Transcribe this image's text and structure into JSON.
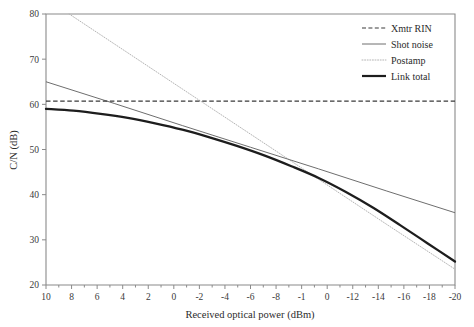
{
  "chart_data": {
    "type": "line",
    "title": "",
    "xlabel": "Received optical power (dBm)",
    "ylabel": "C/N (dB)",
    "xlim": [
      10,
      -20
    ],
    "ylim": [
      20,
      80
    ],
    "x_major_step": 2,
    "x_minor_step": 1,
    "y_major_step": 10,
    "grid": false,
    "legend_position": "top-right",
    "x_tick_labels": [
      "10",
      "8",
      "6",
      "4",
      "2",
      "0",
      "-2",
      "-4",
      "-6",
      "-8",
      "-1",
      "0",
      "-12",
      "-14",
      "-16",
      "-18",
      "-20"
    ],
    "y_tick_labels": [
      "80",
      "70",
      "60",
      "50",
      "40",
      "30",
      "20"
    ],
    "x_tick_values": [
      10,
      8,
      6,
      4,
      2,
      0,
      -2,
      -4,
      -6,
      -8,
      -10,
      -10,
      -12,
      -14,
      -16,
      -18,
      -20
    ],
    "y_tick_values": [
      80,
      70,
      60,
      50,
      40,
      30,
      20
    ],
    "series": [
      {
        "name": "Xmtr RIN",
        "style": "dashed",
        "color": "#3a3a3a",
        "x": [
          10,
          -20
        ],
        "values": [
          60.7,
          60.7
        ]
      },
      {
        "name": "Shot noise",
        "style": "solid-thin",
        "color": "#6e6e6e",
        "x": [
          10,
          5,
          0,
          -5,
          -10,
          -15,
          -20
        ],
        "values": [
          65.0,
          60.2,
          55.3,
          50.5,
          45.7,
          40.8,
          36.0
        ]
      },
      {
        "name": "Postamp",
        "style": "dotted",
        "color": "#b5b5b5",
        "x": [
          8.3,
          5,
          0,
          -5,
          -10,
          -15,
          -20
        ],
        "values": [
          80.0,
          73.4,
          63.4,
          53.4,
          43.4,
          33.4,
          23.5
        ]
      },
      {
        "name": "Link total",
        "style": "solid-thick",
        "color": "#1d1d1d",
        "x": [
          10,
          8,
          6,
          4,
          2,
          0,
          -2,
          -4,
          -6,
          -8,
          -10,
          -12,
          -14,
          -16,
          -18,
          -20
        ],
        "values": [
          59.0,
          58.6,
          57.9,
          57.0,
          55.8,
          54.4,
          52.7,
          50.8,
          48.7,
          46.3,
          43.7,
          40.6,
          37.1,
          33.2,
          29.2,
          25.2
        ]
      }
    ]
  },
  "legend": {
    "items": [
      {
        "label": "Xmtr RIN"
      },
      {
        "label": "Shot noise"
      },
      {
        "label": "Postamp"
      },
      {
        "label": "Link total"
      }
    ]
  },
  "axes": {
    "x_title": "Received optical power (dBm)",
    "y_title": "C/N (dB)"
  }
}
